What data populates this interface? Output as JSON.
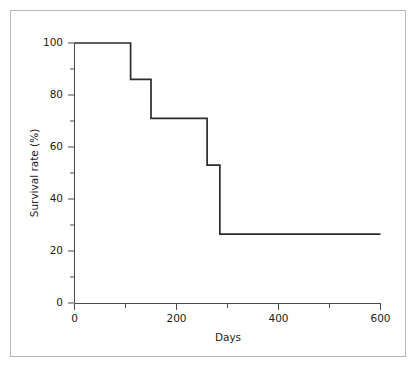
{
  "figure": {
    "background_color": "#ffffff",
    "frame_color": "#b9b9b9",
    "line_color": "#2b2b2b",
    "axis_color": "#4a4a4a"
  },
  "chart_data": {
    "type": "line",
    "subtype": "step-post",
    "title": "",
    "xlabel": "Days",
    "ylabel": "Survival rate (%)",
    "xlim": [
      0,
      600
    ],
    "ylim": [
      0,
      100
    ],
    "grid": false,
    "legend": null,
    "x_ticks_major": [
      0,
      200,
      400,
      600
    ],
    "x_tick_labels": [
      "0",
      "200",
      "400",
      "600"
    ],
    "x_ticks_minor": [
      100,
      300,
      500
    ],
    "y_ticks_major": [
      0,
      20,
      40,
      60,
      80,
      100
    ],
    "y_tick_labels": [
      "0",
      "20",
      "40",
      "60",
      "80",
      "100"
    ],
    "y_ticks_minor": [
      10,
      30,
      50,
      70,
      90
    ],
    "series": [
      {
        "name": "Survival rate",
        "color": "#2b2b2b",
        "x": [
          0,
          110,
          110,
          150,
          150,
          260,
          260,
          285,
          285,
          600
        ],
        "y": [
          100,
          100,
          86,
          86,
          71,
          71,
          53,
          53,
          26.5,
          26.5
        ],
        "steps": [
          {
            "start_day": 0,
            "end_day": 110,
            "survival_pct": 100
          },
          {
            "start_day": 110,
            "end_day": 150,
            "survival_pct": 86
          },
          {
            "start_day": 150,
            "end_day": 260,
            "survival_pct": 71
          },
          {
            "start_day": 260,
            "end_day": 285,
            "survival_pct": 53
          },
          {
            "start_day": 285,
            "end_day": 600,
            "survival_pct": 26.5
          }
        ],
        "event_days": [
          110,
          150,
          260,
          285
        ]
      }
    ]
  }
}
